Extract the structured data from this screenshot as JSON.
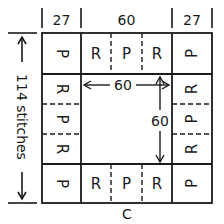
{
  "diagram": {
    "type": "knitting-blanket-layout",
    "column_widths": [
      {
        "label": "27"
      },
      {
        "label": "60"
      },
      {
        "label": "27"
      }
    ],
    "height_label": "114 stitches",
    "bottom_label": "C",
    "center": {
      "width_label": "60",
      "height_label": "60"
    },
    "top_row": [
      "P",
      "R",
      "P",
      "R",
      "P"
    ],
    "bottom_row": [
      "P",
      "R",
      "P",
      "R",
      "P"
    ],
    "left_column_middle": [
      "R",
      "P",
      "R"
    ],
    "right_column_middle": [
      "R",
      "P",
      "R"
    ]
  }
}
